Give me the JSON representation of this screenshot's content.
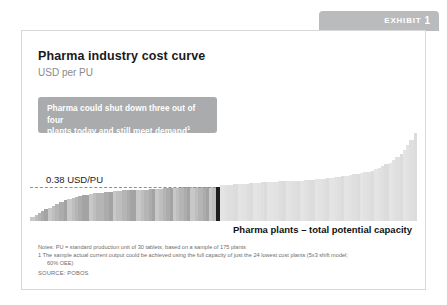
{
  "exhibit": {
    "label": "EXHIBIT",
    "number": "1"
  },
  "card": {
    "title": "Pharma industry cost curve",
    "subtitle": "USD per PU"
  },
  "callout": {
    "line1": "Pharma could shut down three out of four",
    "line2": "plants today and still meet demand",
    "footnote_marker": "1",
    "color": "#a9abad"
  },
  "chart_annotations": {
    "threshold_label": "0.38 USD/PU",
    "xaxis_title": "Pharma plants – total potential capacity"
  },
  "footnotes": {
    "notes_line1": "Notes:  PU = standard production unit of 30 tablets; based on a sample of 175 plants",
    "notes_line2": "1  The sample actual current output could be achieved using the full capacity of just the 24 lowest cost plants (5x3 shift model;",
    "notes_line3": "60% OEE)",
    "source": "SOURCE:  POBOS"
  },
  "chart_data": {
    "type": "bar",
    "title": "Pharma industry cost curve",
    "subtitle": "USD per PU",
    "xlabel": "Pharma plants – total potential capacity",
    "ylabel": "USD per PU",
    "grid": false,
    "legend": false,
    "ylim": [
      0,
      1.0
    ],
    "threshold": {
      "value": 0.38,
      "label": "0.38 USD/PU",
      "style": "dashed",
      "extent_fraction": 0.48
    },
    "colors": {
      "low_cost_segment": "#9a9a9a",
      "highlight_bar": "#1c1c1c",
      "high_cost_segment": "#d9d9d9",
      "background": "#ffffff"
    },
    "series": [
      {
        "name": "Plant unit cost (USD per PU)",
        "widths": [
          3,
          2,
          2,
          2,
          3,
          2,
          2,
          3,
          3,
          2,
          3,
          2,
          2,
          3,
          4,
          3,
          2,
          5,
          3,
          3,
          2,
          4,
          3,
          2,
          4,
          3,
          2,
          3,
          2,
          2,
          3,
          2,
          2,
          3,
          2,
          2,
          2,
          3,
          2,
          2,
          3,
          2,
          3,
          2,
          2,
          2,
          3,
          2,
          3,
          2,
          4,
          3,
          2,
          3,
          2,
          3,
          2,
          3,
          2,
          2,
          4,
          3,
          2,
          3,
          2,
          2,
          3,
          2,
          3,
          2,
          2,
          3,
          2,
          3,
          2,
          2,
          3,
          2,
          3,
          2,
          3,
          2,
          3,
          2,
          2,
          3,
          2,
          2,
          3,
          2,
          2,
          3,
          2,
          2,
          3,
          2,
          2,
          2,
          3,
          2
        ],
        "values": [
          0.04,
          0.07,
          0.09,
          0.11,
          0.13,
          0.15,
          0.17,
          0.19,
          0.21,
          0.23,
          0.25,
          0.26,
          0.27,
          0.28,
          0.29,
          0.3,
          0.31,
          0.31,
          0.32,
          0.32,
          0.33,
          0.33,
          0.34,
          0.34,
          0.34,
          0.35,
          0.35,
          0.35,
          0.36,
          0.36,
          0.36,
          0.36,
          0.37,
          0.37,
          0.37,
          0.37,
          0.37,
          0.38,
          0.38,
          0.38,
          0.38,
          0.38,
          0.38,
          0.38,
          0.38,
          0.38,
          0.38,
          0.38,
          0.4,
          0.4,
          0.4,
          0.41,
          0.41,
          0.41,
          0.41,
          0.42,
          0.42,
          0.42,
          0.43,
          0.43,
          0.43,
          0.43,
          0.44,
          0.44,
          0.44,
          0.45,
          0.45,
          0.45,
          0.45,
          0.46,
          0.46,
          0.46,
          0.47,
          0.47,
          0.47,
          0.48,
          0.48,
          0.49,
          0.49,
          0.5,
          0.5,
          0.51,
          0.52,
          0.52,
          0.53,
          0.54,
          0.55,
          0.56,
          0.58,
          0.59,
          0.61,
          0.63,
          0.65,
          0.68,
          0.71,
          0.75,
          0.79,
          0.84,
          0.9,
          0.98
        ],
        "highlight_index": 47,
        "dark_segment_end_index": 47
      }
    ]
  }
}
